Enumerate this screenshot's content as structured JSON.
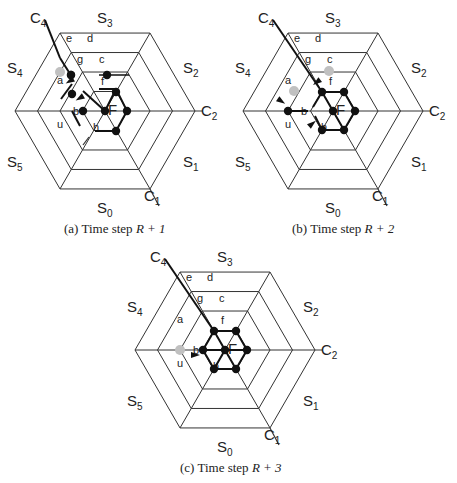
{
  "figures": [
    {
      "id": "a",
      "caption_prefix": "(a) Time step ",
      "caption_math": "R + 1",
      "center": [
        105,
        111
      ],
      "gray_node": "g",
      "black_nodes": [
        "a",
        "c",
        "b",
        "F",
        "f_node",
        "right",
        "bottom"
      ]
    },
    {
      "id": "b",
      "caption_prefix": "(b) Time step ",
      "caption_math": "R + 2",
      "center": [
        333,
        111
      ],
      "gray_nodes": [
        "a",
        "c"
      ],
      "black_nodes": [
        "u",
        "f",
        "F",
        "right",
        "h",
        "bottom"
      ]
    },
    {
      "id": "c",
      "caption_prefix": "(c) Time step ",
      "caption_math": "R + 3",
      "center": [
        225,
        350
      ],
      "gray_node": "u",
      "black_nodes": [
        "hexagon-ring"
      ]
    }
  ],
  "labels": {
    "sectors": [
      "S",
      "S",
      "S",
      "S",
      "S",
      "S"
    ],
    "sector_subs": [
      "0",
      "1",
      "2",
      "3",
      "4",
      "5"
    ],
    "corridors": [
      "C",
      "C",
      "C"
    ],
    "corridor_subs": [
      "1",
      "2",
      "4"
    ],
    "center": "F",
    "cells": [
      "a",
      "b",
      "c",
      "d",
      "e",
      "f",
      "g",
      "h",
      "u"
    ]
  },
  "colors": {
    "line": "#333333",
    "bold_line": "#111111",
    "node": "#111111",
    "gray_node": "#c0c0c0"
  }
}
